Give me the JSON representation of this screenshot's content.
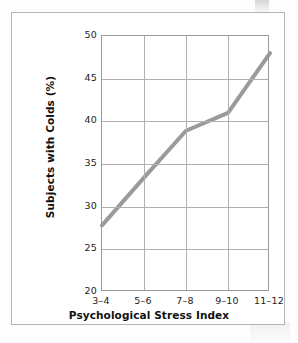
{
  "figure": {
    "background_color": "#ffffff",
    "frame_color": "#b5b5b5"
  },
  "chart_data": {
    "type": "line",
    "title": "",
    "subtitle": "",
    "xlabel": "Psychological Stress Index",
    "ylabel": "Subjects with Colds (%)",
    "categories": [
      "3–4",
      "5–6",
      "7–8",
      "9–10",
      "11–12"
    ],
    "values": [
      27.8,
      33.4,
      38.9,
      41.0,
      48.0
    ],
    "series": [
      {
        "name": "Subjects with Colds (%)",
        "values": [
          27.8,
          33.4,
          38.9,
          41.0,
          48.0
        ],
        "color": "#9a9a9a",
        "line_width": 4
      }
    ],
    "ylim": [
      20,
      50
    ],
    "yticks": [
      50,
      45,
      40,
      35,
      30,
      25,
      20
    ],
    "ytick_labels": [
      "50",
      "45",
      "40",
      "35",
      "30",
      "25",
      "20"
    ],
    "xtick_labels": [
      "3–4",
      "5–6",
      "7–8",
      "9–10",
      "11–12"
    ],
    "grid": true,
    "grid_color": "#b0b0b0",
    "legend": false,
    "legend_position": "none",
    "markers": false,
    "axis_color": "#9a9a9a"
  }
}
